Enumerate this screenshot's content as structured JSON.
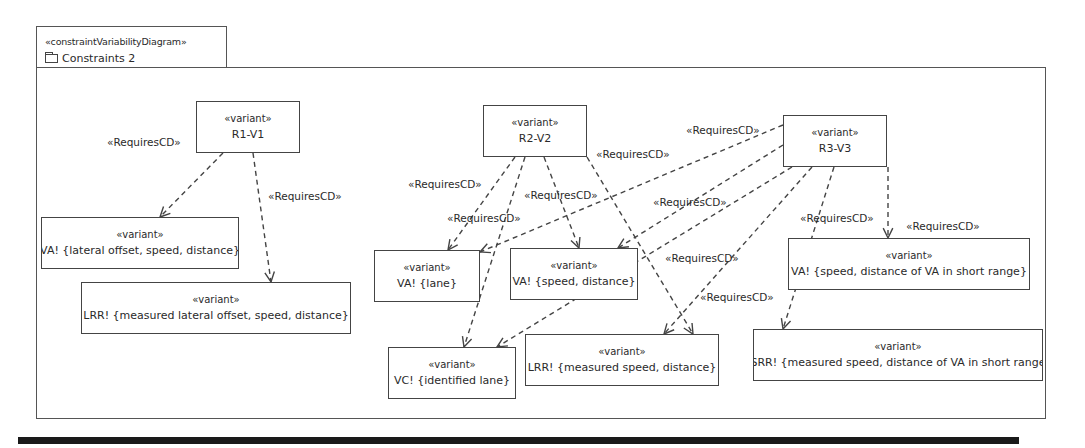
{
  "diagram": {
    "stereotype": "«constraintVariabilityDiagram»",
    "name": "Constraints 2",
    "icon": "folder-icon"
  },
  "nodes": [
    {
      "id": "r1v1",
      "stereotype": "«variant»",
      "label": "R1-V1",
      "x": 196,
      "y": 101,
      "w": 104,
      "h": 52
    },
    {
      "id": "r2v2",
      "stereotype": "«variant»",
      "label": "R2-V2",
      "x": 483,
      "y": 105,
      "w": 104,
      "h": 52
    },
    {
      "id": "r3v3",
      "stereotype": "«variant»",
      "label": "R3-V3",
      "x": 783,
      "y": 115,
      "w": 104,
      "h": 52
    },
    {
      "id": "va1",
      "stereotype": "«variant»",
      "label": "VA! {lateral offset, speed, distance}",
      "x": 41,
      "y": 217,
      "w": 198,
      "h": 52
    },
    {
      "id": "lrr1",
      "stereotype": "«variant»",
      "label": "LRR! {measured lateral offset, speed, distance}",
      "x": 81,
      "y": 282,
      "w": 270,
      "h": 52
    },
    {
      "id": "va2",
      "stereotype": "«variant»",
      "label": "VA! {lane}",
      "x": 374,
      "y": 250,
      "w": 106,
      "h": 52
    },
    {
      "id": "va3",
      "stereotype": "«variant»",
      "label": "VA! {speed, distance}",
      "x": 510,
      "y": 248,
      "w": 128,
      "h": 52
    },
    {
      "id": "vc1",
      "stereotype": "«variant»",
      "label": "VC! {identified lane}",
      "x": 388,
      "y": 347,
      "w": 128,
      "h": 52
    },
    {
      "id": "lrr2",
      "stereotype": "«variant»",
      "label": "LRR! {measured speed, distance}",
      "x": 525,
      "y": 334,
      "w": 194,
      "h": 52
    },
    {
      "id": "va4",
      "stereotype": "«variant»",
      "label": "VA! {speed, distance of VA in short range}",
      "x": 788,
      "y": 238,
      "w": 242,
      "h": 52
    },
    {
      "id": "srr1",
      "stereotype": "«variant»",
      "label": "SRR! {measured speed, distance of VA in short range",
      "x": 753,
      "y": 329,
      "w": 290,
      "h": 52
    }
  ],
  "edges": [
    {
      "from": "r1v1",
      "to": "va1",
      "label": "«RequiresCD»",
      "x1": 223,
      "y1": 153,
      "x2": 160,
      "y2": 217,
      "lx": 107,
      "ly": 136
    },
    {
      "from": "r1v1",
      "to": "lrr1",
      "label": "«RequiresCD»",
      "x1": 253,
      "y1": 153,
      "x2": 271,
      "y2": 282,
      "lx": 268,
      "ly": 190
    },
    {
      "from": "r2v2",
      "to": "va2",
      "label": "«RequiresCD»",
      "x1": 515,
      "y1": 157,
      "x2": 448,
      "y2": 250,
      "lx": 408,
      "ly": 178
    },
    {
      "from": "r2v2",
      "to": "vc1",
      "label": "«RequiresCD»",
      "x1": 525,
      "y1": 157,
      "x2": 464,
      "y2": 347,
      "lx": 447,
      "ly": 212
    },
    {
      "from": "r2v2",
      "to": "va3",
      "label": "«RequiresCD»",
      "x1": 544,
      "y1": 157,
      "x2": 579,
      "y2": 248,
      "lx": 524,
      "ly": 189
    },
    {
      "from": "r2v2",
      "to": "lrr2",
      "label": "«RequiresCD»",
      "x1": 587,
      "y1": 157,
      "x2": 693,
      "y2": 334,
      "lx": 596,
      "ly": 148
    },
    {
      "from": "r3v3",
      "to": "va2",
      "label": "«RequiresCD»",
      "x1": 783,
      "y1": 125,
      "x2": 480,
      "y2": 252,
      "lx": 686,
      "ly": 124
    },
    {
      "from": "r3v3",
      "to": "va3",
      "label": "«RequiresCD»",
      "x1": 783,
      "y1": 145,
      "x2": 618,
      "y2": 248,
      "lx": 653,
      "ly": 196
    },
    {
      "from": "r3v3",
      "to": "vc1",
      "label": "«RequiresCD»",
      "x1": 792,
      "y1": 167,
      "x2": 497,
      "y2": 347,
      "lx": 665,
      "ly": 252
    },
    {
      "from": "r3v3",
      "to": "lrr2",
      "label": "«RequiresCD»",
      "x1": 812,
      "y1": 167,
      "x2": 664,
      "y2": 334,
      "lx": 700,
      "ly": 291
    },
    {
      "from": "r3v3",
      "to": "srr1",
      "label": "«RequiresCD»",
      "x1": 834,
      "y1": 167,
      "x2": 783,
      "y2": 329,
      "lx": 800,
      "ly": 212
    },
    {
      "from": "r3v3",
      "to": "va4",
      "label": "«RequiresCD»",
      "x1": 888,
      "y1": 167,
      "x2": 888,
      "y2": 238,
      "lx": 906,
      "ly": 220
    }
  ],
  "colors": {
    "stroke": "#444444",
    "text": "#2a2a2a",
    "background": "#ffffff",
    "bar": "#1a1a1a"
  }
}
